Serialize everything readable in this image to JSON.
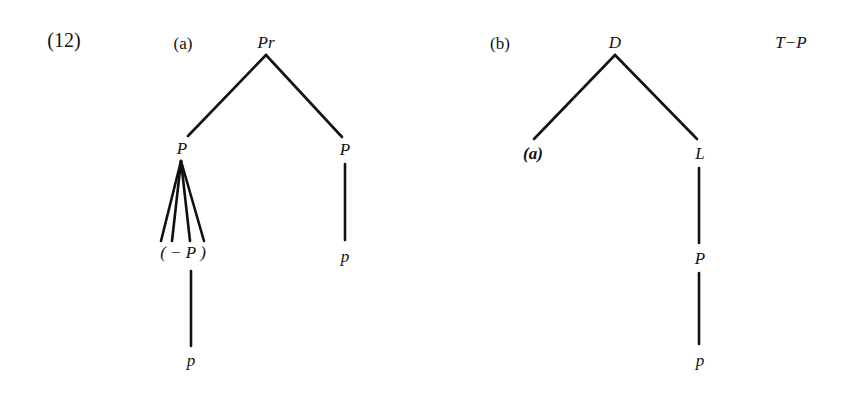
{
  "example_number": "(12)",
  "tree_a": {
    "label": "(a)",
    "root": "Pr",
    "left_child": "P",
    "right_child": "P",
    "fan_node": "( − P )",
    "left_leaf": "p",
    "right_leaf": "p"
  },
  "tree_b": {
    "label": "(b)",
    "root": "D",
    "left_child": "(a)",
    "right_child": "L",
    "mid_node": "P",
    "leaf": "p",
    "side_label": "T−P"
  },
  "colors": {
    "line": "#111111",
    "background": "#ffffff"
  }
}
